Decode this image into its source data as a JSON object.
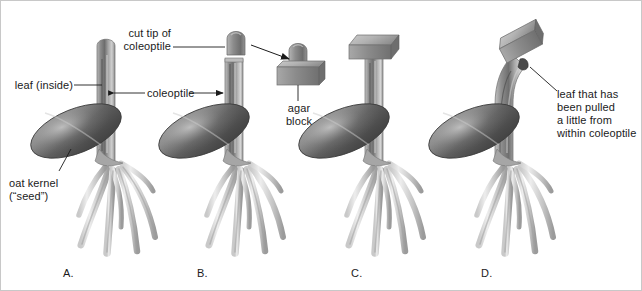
{
  "figure": {
    "background_color": "#ffffff",
    "line_color": "#1b1b1b",
    "plant_tone_dark": "#585858",
    "plant_tone_mid": "#9a9a9a",
    "plant_tone_light": "#d8d8d8"
  },
  "labels": {
    "leaf_inside": "leaf (inside)",
    "oat_kernel_line1": "oat kernel",
    "oat_kernel_line2": "(“seed”)",
    "coleoptile": "coleoptile",
    "cut_tip_line1": "cut tip of",
    "cut_tip_line2": "coleoptile",
    "agar_block_line1": "agar",
    "agar_block_line2": "block",
    "pulled_leaf_line1": "leaf that has",
    "pulled_leaf_line2": "been pulled",
    "pulled_leaf_line3": "a little from",
    "pulled_leaf_line4": "within coleoptile"
  },
  "panels": [
    {
      "letter": "A.",
      "name": "intact-seedling",
      "description": "Intact oat seedling with whole coleoptile and rounded tip, leaf inside, oat kernel and roots"
    },
    {
      "letter": "B.",
      "name": "decapitated-seedling",
      "description": "Seedling with tip cut off; cut tip of coleoptile shown above resting on agar block"
    },
    {
      "letter": "C.",
      "name": "agar-block-centered",
      "description": "Agar block placed centered on top of the cut coleoptile stump; growth stays straight"
    },
    {
      "letter": "D.",
      "name": "agar-block-offset",
      "description": "Agar block placed off-center on angled cut; coleoptile bends and leaf is pulled out a little"
    }
  ]
}
